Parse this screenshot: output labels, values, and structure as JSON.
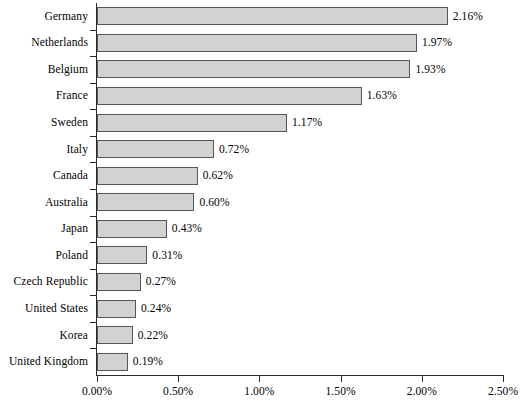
{
  "chart_data": {
    "type": "bar",
    "orientation": "horizontal",
    "title": "",
    "subtitle": "",
    "xlabel": "",
    "ylabel": "",
    "xlim": [
      0,
      2.5
    ],
    "grid": false,
    "legend": null,
    "value_suffix": "%",
    "categories": [
      "Germany",
      "Netherlands",
      "Belgium",
      "France",
      "Sweden",
      "Italy",
      "Canada",
      "Australia",
      "Japan",
      "Poland",
      "Czech Republic",
      "United States",
      "Korea",
      "United Kingdom"
    ],
    "values": [
      2.16,
      1.97,
      1.93,
      1.63,
      1.17,
      0.72,
      0.62,
      0.6,
      0.43,
      0.31,
      0.27,
      0.24,
      0.22,
      0.19
    ],
    "data_labels": [
      "2.16%",
      "1.97%",
      "1.93%",
      "1.63%",
      "1.17%",
      "0.72%",
      "0.62%",
      "0.60%",
      "0.43%",
      "0.31%",
      "0.27%",
      "0.24%",
      "0.22%",
      "0.19%"
    ],
    "x_ticks": [
      0,
      0.5,
      1.0,
      1.5,
      2.0,
      2.5
    ],
    "x_tick_labels": [
      "0.00%",
      "0.50%",
      "1.00%",
      "1.50%",
      "2.00%",
      "2.50%"
    ],
    "colors": {
      "bar_fill": "#d2d2d2",
      "bar_border": "#555555",
      "axis": "#2b2b2b",
      "text": "#000000",
      "background": "#ffffff"
    }
  }
}
